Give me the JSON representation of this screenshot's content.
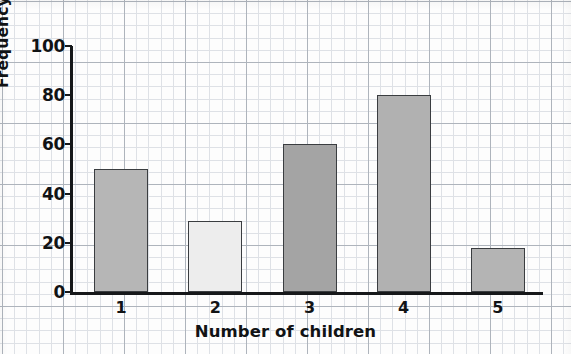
{
  "chart_data": {
    "type": "bar",
    "title": "",
    "categories": [
      "1",
      "2",
      "3",
      "4",
      "5"
    ],
    "values": [
      50,
      29,
      60,
      80,
      18
    ],
    "xlabel": "Number of children",
    "ylabel": "Frequency",
    "ylim": [
      0,
      100
    ],
    "yticks": [
      0,
      20,
      40,
      60,
      80,
      100
    ],
    "ytick_labels": [
      "0",
      "20",
      "40",
      "60",
      "80",
      "100"
    ],
    "grid": true,
    "grid_style": "graph-paper",
    "legend": "none",
    "bar_colors": [
      "#b6b6b6",
      "#ededed",
      "#a4a4a4",
      "#b1b1b1",
      "#b4b4b4"
    ],
    "bar_edge_color": "#3a3d40",
    "axis_color": "#16181a",
    "grid_minor_color": "#d9dde2",
    "grid_major_color": "#a9b0b8",
    "background_color": "#fdfdfd"
  }
}
